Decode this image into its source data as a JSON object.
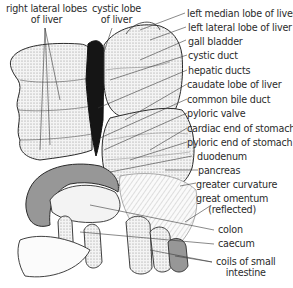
{
  "figure": {
    "colors": {
      "ink": "#2b2b2b",
      "shade": "#9a9a9a",
      "dark": "#111111",
      "paper": "#ffffff"
    },
    "labels_top_left": [
      {
        "id": "right-lateral-lobes",
        "line1": "right lateral lobes",
        "line2": "of liver"
      },
      {
        "id": "cystic-lobe",
        "line1": "cystic lobe",
        "line2": "of liver"
      }
    ],
    "labels_right": [
      "left median lobe of liver",
      "left lateral lobe of liver",
      "gall bladder",
      "cystic duct",
      "hepatic ducts",
      "caudate lobe of liver",
      "common bile duct",
      "pyloric valve",
      "cardiac end of stomach",
      "pyloric end of stomach",
      "duodenum",
      "pancreas",
      "greater curvature"
    ],
    "labels_lower_right": [
      {
        "id": "great-omentum",
        "line1": "great omentum",
        "line2": "(reflected)"
      },
      {
        "id": "colon",
        "line1": "colon"
      },
      {
        "id": "caecum",
        "line1": "caecum"
      },
      {
        "id": "coils-small-intestine",
        "line1": "coils of small",
        "line2": "intestine"
      }
    ]
  }
}
